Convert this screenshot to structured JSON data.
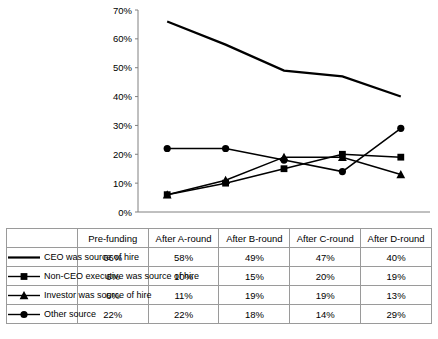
{
  "chart_data": {
    "type": "line",
    "title": "",
    "xlabel": "",
    "ylabel": "",
    "categories": [
      "Pre-funding",
      "After A-round",
      "After B-round",
      "After C-round",
      "After D-round"
    ],
    "ytick_labels": [
      "0%",
      "10%",
      "20%",
      "30%",
      "40%",
      "50%",
      "60%",
      "70%"
    ],
    "ytick_values": [
      0,
      10,
      20,
      30,
      40,
      50,
      60,
      70
    ],
    "ylim": [
      0,
      70
    ],
    "grid": false,
    "legend_position": "table-below",
    "series": [
      {
        "name": "CEO was source of hire",
        "marker": "none",
        "color": "#000000",
        "values": [
          66,
          58,
          49,
          47,
          40
        ],
        "labels": [
          "66%",
          "58%",
          "49%",
          "47%",
          "40%"
        ]
      },
      {
        "name": "Non-CEO executive was source of hire",
        "marker": "square",
        "color": "#000000",
        "values": [
          6,
          10,
          15,
          20,
          19
        ],
        "labels": [
          "6%",
          "10%",
          "15%",
          "20%",
          "19%"
        ]
      },
      {
        "name": "Investor was source of hire",
        "marker": "triangle",
        "color": "#000000",
        "values": [
          6,
          11,
          19,
          19,
          13
        ],
        "labels": [
          "6%",
          "11%",
          "19%",
          "19%",
          "13%"
        ]
      },
      {
        "name": "Other source",
        "marker": "circle",
        "color": "#000000",
        "values": [
          22,
          22,
          18,
          14,
          29
        ],
        "labels": [
          "22%",
          "22%",
          "18%",
          "14%",
          "29%"
        ]
      }
    ]
  },
  "table": {
    "header_row": [
      "Pre-funding",
      "After A-round",
      "After B-round",
      "After C-round",
      "After D-round"
    ],
    "rows": [
      {
        "label": "CEO was source of hire",
        "marker": "none",
        "values": [
          "66%",
          "58%",
          "49%",
          "47%",
          "40%"
        ]
      },
      {
        "label": "Non-CEO executive was source of hire",
        "marker": "square",
        "values": [
          "6%",
          "10%",
          "15%",
          "20%",
          "19%"
        ]
      },
      {
        "label": "Investor was source of hire",
        "marker": "triangle",
        "values": [
          "6%",
          "11%",
          "19%",
          "19%",
          "13%"
        ]
      },
      {
        "label": "Other source",
        "marker": "circle",
        "values": [
          "22%",
          "22%",
          "18%",
          "14%",
          "29%"
        ]
      }
    ]
  }
}
